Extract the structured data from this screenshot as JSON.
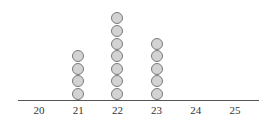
{
  "chart_data": {
    "type": "scatter",
    "subtype": "dot_plot",
    "title": "",
    "xlabel": "",
    "ylabel": "",
    "categories": [
      "20",
      "21",
      "22",
      "23",
      "24",
      "25"
    ],
    "values": [
      0,
      4,
      7,
      5,
      0,
      0
    ],
    "x": [
      20,
      21,
      22,
      23,
      24,
      25
    ],
    "xlim": [
      20,
      25
    ],
    "grid": false,
    "legend": null,
    "marker": {
      "fill": "#d3d3d3",
      "stroke": "#7a7a7a",
      "shape": "circle"
    }
  }
}
